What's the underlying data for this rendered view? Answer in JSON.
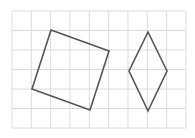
{
  "diagram": {
    "grid": {
      "x0": 12,
      "y0": 11,
      "cols": 9,
      "rows": 6,
      "cell_w": 19.33,
      "cell_h": 19.5,
      "line_color": "#dcdcdc"
    },
    "shapes": [
      {
        "name": "square",
        "stroke": "#555555",
        "points": [
          [
            51,
            30
          ],
          [
            109,
            51
          ],
          [
            90,
            110
          ],
          [
            32,
            89
          ]
        ]
      },
      {
        "name": "rhombus",
        "stroke": "#555555",
        "points": [
          [
            148,
            32
          ],
          [
            167,
            71
          ],
          [
            148,
            111
          ],
          [
            129,
            71
          ]
        ]
      }
    ]
  }
}
